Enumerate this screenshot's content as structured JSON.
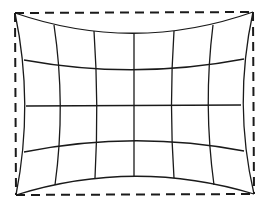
{
  "diagram": {
    "title": "Pincushion distortion grid",
    "type": "pincushion-distortion",
    "stroke_color": "#1a1a1a",
    "background": "#ffffff",
    "reference_frame": {
      "style": "dashed",
      "corners": {
        "tl": [
          15,
          13
        ],
        "tr": [
          253,
          12
        ],
        "bl": [
          16,
          195
        ],
        "br": [
          254,
          194
        ]
      }
    },
    "grid": {
      "columns": 6,
      "rows": 4
    }
  }
}
